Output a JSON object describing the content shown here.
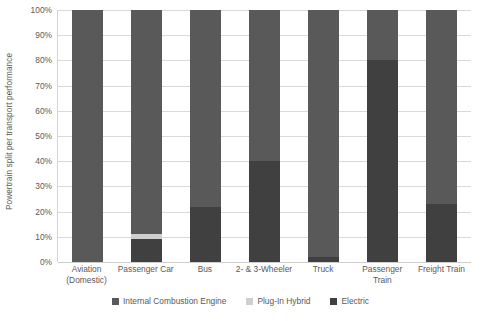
{
  "chart_data": {
    "type": "bar",
    "stacked": true,
    "title": "",
    "xlabel": "",
    "ylabel": "Powertrain split per transport performance",
    "ylim": [
      0,
      100
    ],
    "grid": true,
    "legend_position": "bottom",
    "categories": [
      "Aviation (Domestic)",
      "Passenger Car",
      "Bus",
      "2- & 3-Wheeler",
      "Truck",
      "Passenger Train",
      "Freight Train"
    ],
    "category_lines": [
      [
        "Aviation",
        "(Domestic)"
      ],
      [
        "Passenger Car"
      ],
      [
        "Bus"
      ],
      [
        "2- & 3-Wheeler"
      ],
      [
        "Truck"
      ],
      [
        "Passenger Train"
      ],
      [
        "Freight Train"
      ]
    ],
    "y_ticks": [
      "0%",
      "10%",
      "20%",
      "30%",
      "40%",
      "50%",
      "60%",
      "70%",
      "80%",
      "90%",
      "100%"
    ],
    "y_tick_values": [
      0,
      10,
      20,
      30,
      40,
      50,
      60,
      70,
      80,
      90,
      100
    ],
    "series": [
      {
        "name": "Internal Combustion Engine",
        "color": "#595959",
        "values": [
          100,
          89,
          78,
          60,
          98,
          20,
          77
        ]
      },
      {
        "name": "Plug-In Hybrid",
        "color": "#d0cece",
        "values": [
          0,
          2,
          0,
          0,
          0,
          0,
          0
        ]
      },
      {
        "name": "Electric",
        "color": "#404040",
        "values": [
          0,
          9,
          22,
          40,
          2,
          80,
          23
        ]
      }
    ]
  },
  "legend": {
    "items": [
      {
        "label": "Internal Combustion Engine",
        "color": "#595959"
      },
      {
        "label": "Plug-In Hybrid",
        "color": "#d0cece"
      },
      {
        "label": "Electric",
        "color": "#404040"
      }
    ]
  }
}
